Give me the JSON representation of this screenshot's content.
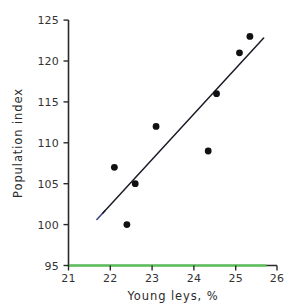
{
  "chart_data": {
    "type": "scatter",
    "title": "",
    "xlabel": "Young leys, %",
    "ylabel": "Population index",
    "xlim": [
      21,
      26
    ],
    "ylim": [
      95,
      125
    ],
    "xticks": [
      21,
      22,
      23,
      24,
      25,
      26
    ],
    "yticks": [
      95,
      100,
      105,
      110,
      115,
      120,
      125
    ],
    "xtick_labels": [
      "21",
      "22",
      "23",
      "24",
      "25",
      "26"
    ],
    "ytick_labels": [
      "95",
      "100",
      "105",
      "110",
      "115",
      "120",
      "125"
    ],
    "grid": false,
    "legend": null,
    "points": [
      {
        "x": 22.1,
        "y": 107
      },
      {
        "x": 22.4,
        "y": 100
      },
      {
        "x": 22.6,
        "y": 105
      },
      {
        "x": 23.1,
        "y": 112
      },
      {
        "x": 24.35,
        "y": 109
      },
      {
        "x": 24.55,
        "y": 116
      },
      {
        "x": 25.1,
        "y": 121
      },
      {
        "x": 25.35,
        "y": 123
      }
    ],
    "series": [
      {
        "name": "observations",
        "x": [
          22.1,
          22.4,
          22.6,
          23.1,
          24.35,
          24.55,
          25.1,
          25.35
        ],
        "values": [
          107,
          100,
          105,
          112,
          109,
          116,
          121,
          123
        ],
        "marker": "circle",
        "color": "#111111"
      },
      {
        "name": "regression-line",
        "type": "line",
        "x": [
          21.82,
          25.68
        ],
        "values": [
          101.4,
          122.8
        ],
        "color": "#1c1c28"
      }
    ],
    "annotations": [
      {
        "name": "x-axis-green-highlight",
        "color": "#5fc75f",
        "x_start": 21,
        "x_end": 25.75,
        "y": 95
      }
    ]
  },
  "axis": {
    "x_title": "Young leys, %",
    "y_title": "Population index"
  },
  "colors": {
    "background": "#ffffff",
    "axis": "#2b2b2b",
    "point": "#111111",
    "fit_line": "#1c1c28",
    "highlight_green": "#5fc75f",
    "fit_line_tip": "#3b3f86"
  }
}
